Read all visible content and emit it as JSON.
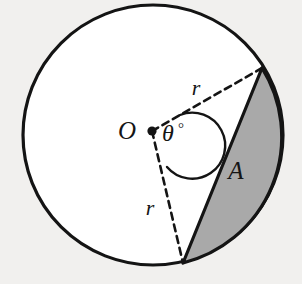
{
  "figure": {
    "kind": "circle-sector-segment-diagram",
    "background_color": "#f1f0ee"
  },
  "circle": {
    "name": "circle-outline",
    "center_x": 153,
    "center_y": 135,
    "radius": 130,
    "stroke_color": "#141414",
    "stroke_width": 3.2,
    "fill_color": "#ffffff"
  },
  "center_point": {
    "name": "centre-point-o",
    "x": 152,
    "y": 131,
    "dot_radius": 4.6,
    "color": "#141414",
    "label": "O",
    "label_x": 127,
    "label_y": 139
  },
  "radii": [
    {
      "name": "radius-upper",
      "label": "r",
      "from_x": 152,
      "from_y": 131,
      "to_x": 262,
      "to_y": 68,
      "label_x": 196,
      "label_y": 95,
      "style": "dashed",
      "stroke_color": "#141414",
      "stroke_width": 2.6,
      "dash_pattern": "7 5"
    },
    {
      "name": "radius-lower",
      "label": "r",
      "from_x": 152,
      "from_y": 131,
      "to_x": 183,
      "to_y": 263,
      "label_x": 150,
      "label_y": 215,
      "style": "dashed",
      "stroke_color": "#141414",
      "stroke_width": 2.6,
      "dash_pattern": "7 5"
    }
  ],
  "angle": {
    "name": "central-angle",
    "label_theta": "θ",
    "label_degree": "°",
    "label_x": 162,
    "label_y": 141,
    "arc_path": "M 180 115 A 33 33 0 1 1 167 167",
    "stroke_color": "#141414",
    "stroke_width": 2.4
  },
  "segment": {
    "name": "shaded-segment",
    "label": "A",
    "label_x": 236,
    "label_y": 179,
    "fill_color": "#a9a9a9",
    "stroke_color": "#141414",
    "stroke_width": 3.2,
    "chord_start_x": 262,
    "chord_start_y": 68,
    "chord_end_x": 183,
    "chord_end_y": 263,
    "path": "M 262 68 A 130 130 0 0 1 183 263 L 262 68 Z"
  }
}
